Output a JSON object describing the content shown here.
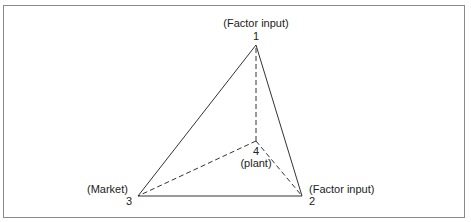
{
  "diagram": {
    "type": "location-triangle",
    "vertices": [
      {
        "id": "1",
        "number": "1",
        "label": "(Factor input)",
        "x": 256,
        "y": 45
      },
      {
        "id": "2",
        "number": "2",
        "label": "(Factor input)",
        "x": 302,
        "y": 196
      },
      {
        "id": "3",
        "number": "3",
        "label": "(Market)",
        "x": 138,
        "y": 196
      },
      {
        "id": "4",
        "number": "4",
        "label": "(plant)",
        "x": 256,
        "y": 141
      }
    ],
    "solid_edges": [
      [
        "1",
        "2"
      ],
      [
        "2",
        "3"
      ],
      [
        "3",
        "1"
      ]
    ],
    "dashed_edges": [
      [
        "4",
        "1"
      ],
      [
        "4",
        "2"
      ],
      [
        "4",
        "3"
      ]
    ],
    "colors": {
      "line": "#333333",
      "frame": "#8a8a8a"
    }
  }
}
